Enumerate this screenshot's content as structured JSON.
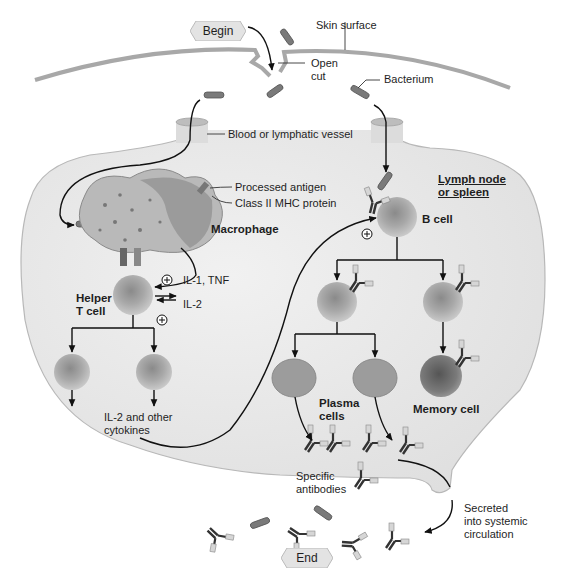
{
  "diagram": {
    "flow": {
      "start": "Begin",
      "end": "End"
    },
    "labels": {
      "skin_surface": "Skin surface",
      "open_cut_1": "Open",
      "open_cut_2": "cut",
      "bacterium": "Bacterium",
      "vessel": "Blood or lymphatic vessel",
      "processed_antigen": "Processed antigen",
      "mhc": "Class II MHC protein",
      "macrophage": "Macrophage",
      "il1_tnf": "IL-1, TNF",
      "il2": "IL-2",
      "helper_1": "Helper",
      "helper_2": "T cell",
      "lymph_1": "Lymph node",
      "lymph_2": "or spleen",
      "b_cell": "B cell",
      "cytokines_1": "IL-2 and other",
      "cytokines_2": "cytokines",
      "plasma_1": "Plasma",
      "plasma_2": "cells",
      "memory": "Memory cell",
      "antibodies_1": "Specific",
      "antibodies_2": "antibodies",
      "secreted_1": "Secreted",
      "secreted_2": "into systemic",
      "secreted_3": "circulation"
    },
    "symbols": {
      "stimulate": "+"
    },
    "colors": {
      "tissue": "#e6e6e6",
      "tissue_edge": "#b5b5b5",
      "skin": "#a9a9a9",
      "cell": "#9a9a9a",
      "cell_dark": "#6e6e6e",
      "bacterium": "#7a7a7a",
      "arrow": "#111111"
    }
  }
}
